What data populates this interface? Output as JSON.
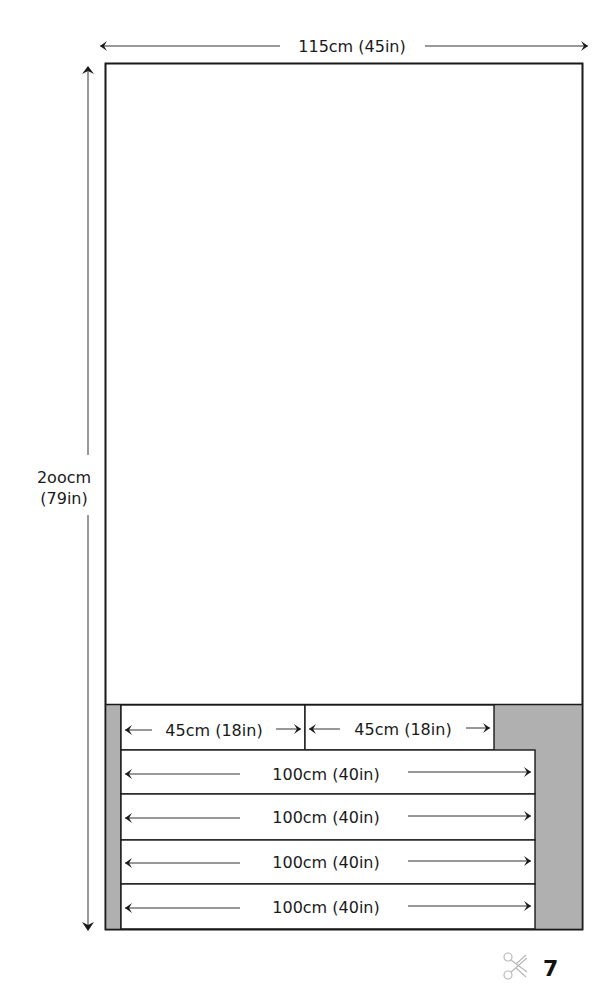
{
  "diagram": {
    "title_fragment": "",
    "fabric": {
      "width_label": "115cm (45in)",
      "length_label_line1": "2oocm",
      "length_label_line2": "(79in)"
    },
    "pieces": [
      {
        "label": "45cm (18in)",
        "row": 1,
        "col": 1
      },
      {
        "label": "45cm (18in)",
        "row": 1,
        "col": 2
      },
      {
        "label": "100cm (40in)",
        "row": 2
      },
      {
        "label": "100cm (40in)",
        "row": 3
      },
      {
        "label": "100cm (40in)",
        "row": 4
      },
      {
        "label": "100cm (40in)",
        "row": 5
      }
    ],
    "colors": {
      "waste_fill": "#b0b0b0",
      "stroke": "#1a1a1a",
      "fabric_fill": "#ffffff"
    }
  },
  "footer": {
    "icon": "scissors-icon",
    "page_number": "7"
  }
}
